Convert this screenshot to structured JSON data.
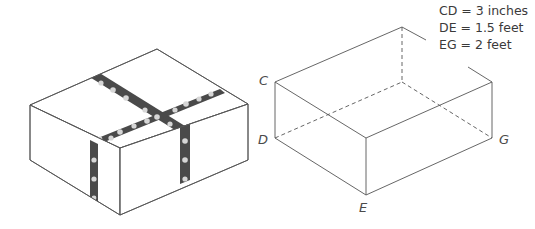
{
  "figure": {
    "left_box": {
      "description": "gift box wrapped with polka-dot ribbon",
      "ribbon_color": "#4a4a4a",
      "dot_color": "#d6d6d6",
      "edge_color": "#555555"
    },
    "right_box": {
      "description": "open box with dashed hidden edges",
      "vertex_labels": {
        "C": "C",
        "D": "D",
        "E": "E",
        "G": "G"
      },
      "edge_color": "#555555"
    },
    "measurements": [
      {
        "text": "CD = 3 inches"
      },
      {
        "text": "DE = 1.5 feet"
      },
      {
        "text": "EG = 2 feet"
      }
    ]
  }
}
